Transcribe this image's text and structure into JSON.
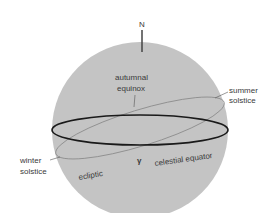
{
  "diagram": {
    "labels": {
      "north": "N",
      "autumnal_equinox_1": "autumnal",
      "autumnal_equinox_2": "equinox",
      "summer_solstice_1": "summer",
      "summer_solstice_2": "solstice",
      "winter_solstice_1": "winter",
      "winter_solstice_2": "solstice",
      "vernal_equinox_symbol": "γ",
      "celestial_equator": "celestial equator",
      "ecliptic": "ecliptic"
    },
    "colors": {
      "sphere": "#c4c4c4",
      "equator": "#1a1a1a",
      "ecliptic": "#8a8a8a",
      "text": "#3a3a3a"
    }
  }
}
